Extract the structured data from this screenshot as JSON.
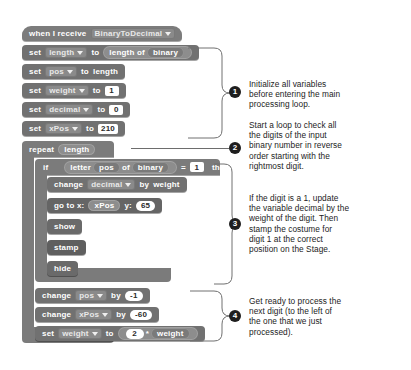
{
  "script": {
    "hat": {
      "words": [
        "when",
        "I",
        "receive"
      ],
      "text": "when I receive",
      "message": "BinaryToDecimal"
    },
    "blocks": [
      {
        "id": "set-length",
        "keyword": "set",
        "variable": "length",
        "to": "to",
        "reporter": "length of",
        "reporter_arg": "binary"
      },
      {
        "id": "set-pos",
        "keyword": "set",
        "variable": "pos",
        "to": "to",
        "value": "length"
      },
      {
        "id": "set-weight",
        "keyword": "set",
        "variable": "weight",
        "to": "to",
        "value": "1"
      },
      {
        "id": "set-decimal",
        "keyword": "set",
        "variable": "decimal",
        "to": "to",
        "value": "0"
      },
      {
        "id": "set-xpos",
        "keyword": "set",
        "variable": "xPos",
        "to": "to",
        "value": "210"
      }
    ],
    "repeat": {
      "keyword": "repeat",
      "times": "length"
    },
    "if": {
      "keyword": "if",
      "then": "then",
      "letter_word": "letter",
      "of_word": "of",
      "index": "pos",
      "string": "binary",
      "operator": "=",
      "compare_value": "1"
    },
    "if_body": [
      {
        "id": "change-decimal",
        "keyword": "change",
        "variable": "decimal",
        "by": "by",
        "value": "weight"
      },
      {
        "id": "go-to-xy",
        "label_x": "go to x:",
        "x": "xPos",
        "label_y": "y:",
        "y": "65"
      },
      {
        "id": "show",
        "label": "show"
      },
      {
        "id": "stamp",
        "label": "stamp"
      },
      {
        "id": "hide",
        "label": "hide"
      }
    ],
    "after_if": [
      {
        "id": "change-pos",
        "keyword": "change",
        "variable": "pos",
        "by": "by",
        "value": "-1"
      },
      {
        "id": "change-xpos",
        "keyword": "change",
        "variable": "xPos",
        "by": "by",
        "value": "-60"
      },
      {
        "id": "set-weight-2",
        "keyword": "set",
        "variable": "weight",
        "to": "to",
        "value_a": "2",
        "operator": "*",
        "value_b": "weight"
      }
    ]
  },
  "annotations": [
    {
      "number": "1",
      "text": "Initialize all variables\nbefore entering the main\nprocessing loop."
    },
    {
      "number": "2",
      "text": "Start a loop to check all\nthe digits of the input\nbinary number in reverse\norder starting with the\nrightmost digit."
    },
    {
      "number": "3",
      "text": "If the digit is a 1, update\nthe variable decimal by the\nweight of the digit. Then\nstamp the costume for\ndigit 1 at the correct\nposition on the Stage."
    },
    {
      "number": "4",
      "text": "Get ready to process the\nnext digit (to the left of\nthe one that we just\nprocessed)."
    }
  ],
  "colors": {
    "block_generic": "#6f6f6f",
    "block_control": "#7b7b7b",
    "reporter": "#8d8d8d",
    "input_bg": "#ffffff",
    "text": "#ffffff",
    "annotation_text": "#1c1c1c",
    "bullet_bg": "#1e1e1e",
    "page_bg": "#ffffff"
  }
}
